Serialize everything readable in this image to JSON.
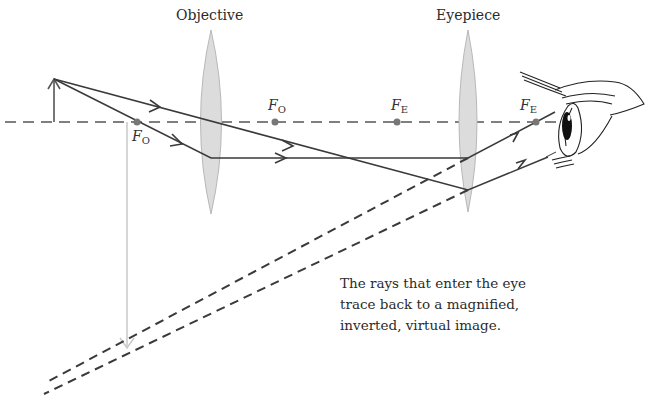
{
  "diagram": {
    "labels": {
      "objective": "Objective",
      "eyepiece": "Eyepiece"
    },
    "focal_points": [
      {
        "id": "fo-left",
        "symbol": "F",
        "subscript": "O"
      },
      {
        "id": "fo-right",
        "symbol": "F",
        "subscript": "O"
      },
      {
        "id": "fe-left",
        "symbol": "F",
        "subscript": "E"
      },
      {
        "id": "fe-right",
        "symbol": "F",
        "subscript": "E"
      }
    ],
    "caption": {
      "line1": "The rays that enter the eye",
      "line2": "trace back to a magnified,",
      "line3": "inverted, virtual image."
    },
    "colors": {
      "ray": "#3a3a3a",
      "axis": "#555555",
      "lens_fill": "#d9d9d9",
      "image_arrow": "#c8c8c8",
      "object_arrow": "#555555",
      "focal_dot": "#777777"
    }
  }
}
